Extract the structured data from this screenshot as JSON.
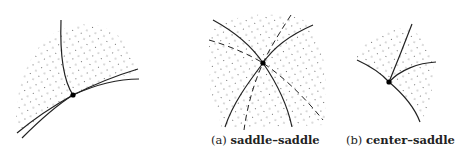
{
  "figure": {
    "panels": [
      {
        "id": "main",
        "caption_label": "",
        "caption_text": ""
      },
      {
        "id": "a",
        "caption_label": "(a)",
        "caption_text": "saddle–saddle"
      },
      {
        "id": "b",
        "caption_label": "(b)",
        "caption_text": "center–saddle"
      }
    ],
    "colors": {
      "line": "#222222",
      "dots": "#555555",
      "background": "#ffffff"
    }
  }
}
